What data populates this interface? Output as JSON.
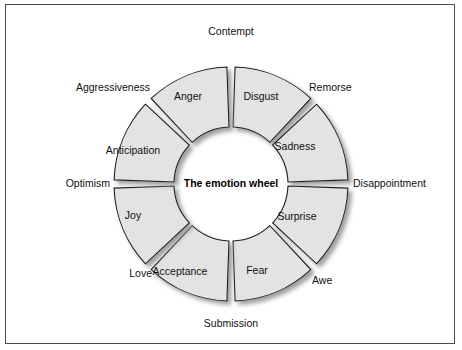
{
  "figure": {
    "center_title": "The emotion wheel",
    "frame_color": "#4a4a4a",
    "background_color": "#ffffff",
    "segment_fill": "#e3e3e3",
    "segment_stroke": "#1a1a1a",
    "shadow_color": "#9a9a9a"
  },
  "chart_data": {
    "type": "pie",
    "title": "The emotion wheel",
    "xlabel": "",
    "ylabel": "",
    "legend": "none",
    "grid": false,
    "categories": [
      "Disgust",
      "Sadness",
      "Surprise",
      "Fear",
      "Acceptance",
      "Joy",
      "Anticipation",
      "Anger"
    ],
    "values": [
      12.5,
      12.5,
      12.5,
      12.5,
      12.5,
      12.5,
      12.5,
      12.5
    ],
    "annotations": [
      "Contempt",
      "Remorse",
      "Disappointment",
      "Awe",
      "Submission",
      "Love",
      "Optimism",
      "Aggressiveness"
    ]
  },
  "segments": [
    {
      "label": "Disgust",
      "start_deg": 272,
      "end_deg": 313,
      "label_x": 261,
      "label_y": 97
    },
    {
      "label": "Sadness",
      "start_deg": 317,
      "end_deg": 358,
      "label_x": 295,
      "label_y": 147
    },
    {
      "label": "Surprise",
      "start_deg": 2,
      "end_deg": 43,
      "label_x": 297,
      "label_y": 217
    },
    {
      "label": "Fear",
      "start_deg": 47,
      "end_deg": 88,
      "label_x": 257,
      "label_y": 271
    },
    {
      "label": "Acceptance",
      "start_deg": 92,
      "end_deg": 133,
      "label_x": 180,
      "label_y": 272
    },
    {
      "label": "Joy",
      "start_deg": 137,
      "end_deg": 178,
      "label_x": 133,
      "label_y": 216
    },
    {
      "label": "Anticipation",
      "start_deg": 182,
      "end_deg": 223,
      "label_x": 133,
      "label_y": 151
    },
    {
      "label": "Anger",
      "start_deg": 227,
      "end_deg": 268,
      "label_x": 188,
      "label_y": 97
    }
  ],
  "dyads": [
    {
      "label": "Contempt",
      "x": 231,
      "y": 32,
      "anchor": "middle"
    },
    {
      "label": "Remorse",
      "x": 309,
      "y": 88,
      "anchor": "start"
    },
    {
      "label": "Disappointment",
      "x": 353,
      "y": 184,
      "anchor": "start"
    },
    {
      "label": "Awe",
      "x": 312,
      "y": 281,
      "anchor": "start"
    },
    {
      "label": "Submission",
      "x": 231,
      "y": 324,
      "anchor": "middle"
    },
    {
      "label": "Love",
      "x": 152,
      "y": 274,
      "anchor": "end"
    },
    {
      "label": "Optimism",
      "x": 110,
      "y": 184,
      "anchor": "end"
    },
    {
      "label": "Aggressiveness",
      "x": 150,
      "y": 88,
      "anchor": "end"
    }
  ],
  "geometry": {
    "cx": 231,
    "cy": 184,
    "inner_radius": 57,
    "outer_radius": 117
  }
}
